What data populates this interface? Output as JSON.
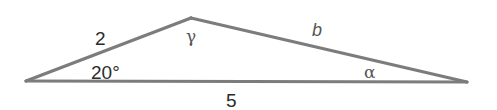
{
  "diagram": {
    "type": "triangle",
    "vertices": {
      "left": {
        "x": 26,
        "y": 81
      },
      "top": {
        "x": 191,
        "y": 18
      },
      "right": {
        "x": 467,
        "y": 82
      }
    },
    "sides": {
      "left_side": "2",
      "right_side": "b",
      "base": "5"
    },
    "angles": {
      "left_angle": "20°",
      "top_angle": "γ",
      "right_angle": "α"
    },
    "colors": {
      "line": "#7c7c7c",
      "text": "#2b2b2b"
    }
  }
}
